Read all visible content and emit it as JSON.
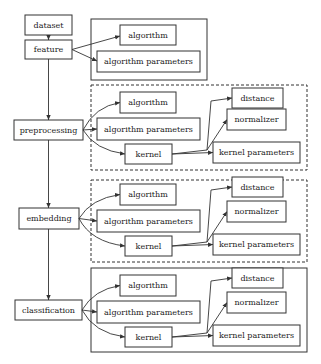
{
  "diagram": {
    "nodes": {
      "dataset": "dataset",
      "feature": "feature",
      "preprocessing": "preprocessing",
      "embedding": "embedding",
      "classification": "classification"
    },
    "groups": [
      {
        "stage": "feature",
        "border": "solid",
        "items": {
          "algorithm": "algorithm",
          "algorithm_parameters": "algorithm parameters"
        }
      },
      {
        "stage": "preprocessing",
        "border": "dashed",
        "items": {
          "algorithm": "algorithm",
          "algorithm_parameters": "algorithm parameters",
          "kernel": "kernel",
          "distance": "distance",
          "normalizer": "normalizer",
          "kernel_parameters": "kernel parameters"
        }
      },
      {
        "stage": "embedding",
        "border": "dashed",
        "items": {
          "algorithm": "algorithm",
          "algorithm_parameters": "algorithm parameters",
          "kernel": "kernel",
          "distance": "distance",
          "normalizer": "normalizer",
          "kernel_parameters": "kernel parameters"
        }
      },
      {
        "stage": "classification",
        "border": "solid",
        "items": {
          "algorithm": "algorithm",
          "algorithm_parameters": "algorithm parameters",
          "kernel": "kernel",
          "distance": "distance",
          "normalizer": "normalizer",
          "kernel_parameters": "kernel parameters"
        }
      }
    ],
    "edges": [
      [
        "dataset",
        "feature"
      ],
      [
        "feature",
        "preprocessing"
      ],
      [
        "preprocessing",
        "embedding"
      ],
      [
        "embedding",
        "classification"
      ],
      [
        "feature",
        "algorithm"
      ],
      [
        "feature",
        "algorithm parameters"
      ],
      [
        "stage",
        "algorithm"
      ],
      [
        "stage",
        "algorithm parameters"
      ],
      [
        "stage",
        "kernel"
      ],
      [
        "kernel",
        "distance"
      ],
      [
        "kernel",
        "normalizer"
      ],
      [
        "kernel",
        "kernel parameters"
      ]
    ]
  }
}
